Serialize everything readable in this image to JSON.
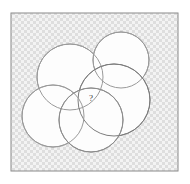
{
  "figure": {
    "kind": "geometry-puzzle-diagram",
    "canvas": {
      "width": 190,
      "height": 184
    },
    "background_color": "#ffffff"
  },
  "frame": {
    "name": "outer-square",
    "x": 11,
    "y": 13,
    "width": 167,
    "height": 158,
    "stroke_color": "#8a8a8a",
    "stroke_width": 1,
    "fill_color": "#e8e8e8",
    "hatch": {
      "pattern": "cross-hatch-checker",
      "cell_size": 3,
      "color_light": "#f4f4f4",
      "color_dark": "#dcdcdc"
    }
  },
  "circles": [
    {
      "id": "circle-top-left",
      "label": "A",
      "cx": 70,
      "cy": 77,
      "r": 33,
      "stroke_color": "#9a9a9a",
      "stroke_width": 1,
      "fill_color": "#fdfdfd"
    },
    {
      "id": "circle-top-right",
      "label": "B",
      "cx": 121,
      "cy": 60,
      "r": 28,
      "stroke_color": "#9a9a9a",
      "stroke_width": 1,
      "fill_color": "#fdfdfd"
    },
    {
      "id": "circle-right",
      "label": "C",
      "cx": 114,
      "cy": 100,
      "r": 36,
      "stroke_color": "#7d7d7d",
      "stroke_width": 1,
      "fill_color": "#fdfdfd"
    },
    {
      "id": "circle-bottom-left",
      "label": "D",
      "cx": 53,
      "cy": 116,
      "r": 31,
      "stroke_color": "#9a9a9a",
      "stroke_width": 1,
      "fill_color": "#fdfdfd"
    },
    {
      "id": "circle-bottom-center",
      "label": "E",
      "cx": 91,
      "cy": 120,
      "r": 32,
      "stroke_color": "#8c8c8c",
      "stroke_width": 1,
      "fill_color": "#fdfdfd"
    }
  ],
  "annotations": {
    "unknown_marker": {
      "text": "?",
      "x": 91,
      "y": 101,
      "font_size": 9,
      "color": "#3a3a3a"
    }
  }
}
